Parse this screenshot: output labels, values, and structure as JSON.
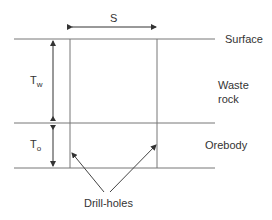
{
  "diagram": {
    "spacing_label": "S",
    "waste_thickness_label": {
      "main": "T",
      "sub": "w"
    },
    "ore_thickness_label": {
      "main": "T",
      "sub": "o"
    },
    "layers": {
      "surface": "Surface",
      "waste_line1": "Waste",
      "waste_line2": "rock",
      "orebody": "Orebody"
    },
    "pointer_label": "Drill-holes",
    "colors": {
      "line": "#555555",
      "text": "#333333"
    }
  }
}
